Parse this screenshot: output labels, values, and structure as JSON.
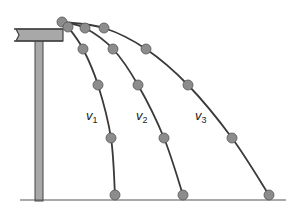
{
  "diagram": {
    "type": "projectile-trajectories",
    "colors": {
      "ball_fill": "#8c8c8c",
      "ball_stroke": "#555555",
      "path": "#3a3a3a",
      "table_fill": "#a8a8a8",
      "table_stroke": "#444444",
      "ground": "#555555"
    },
    "launch_point": {
      "x": 62,
      "y": 22
    },
    "ground_y": 200,
    "trajectories": [
      {
        "name": "v1",
        "label_var": "v",
        "label_sub": "1",
        "label_pos": {
          "x": 86,
          "y": 109
        },
        "points": [
          [
            68,
            27
          ],
          [
            83,
            49
          ],
          [
            98,
            85
          ],
          [
            111,
            138
          ],
          [
            115,
            195
          ]
        ]
      },
      {
        "name": "v2",
        "label_var": "v",
        "label_sub": "2",
        "label_pos": {
          "x": 136,
          "y": 109
        },
        "points": [
          [
            85,
            28
          ],
          [
            113,
            49
          ],
          [
            138,
            85
          ],
          [
            164,
            138
          ],
          [
            183,
            195
          ]
        ]
      },
      {
        "name": "v3",
        "label_var": "v",
        "label_sub": "3",
        "label_pos": {
          "x": 195,
          "y": 109
        },
        "points": [
          [
            104,
            28
          ],
          [
            146,
            49
          ],
          [
            188,
            85
          ],
          [
            232,
            138
          ],
          [
            269,
            195
          ]
        ]
      }
    ]
  }
}
